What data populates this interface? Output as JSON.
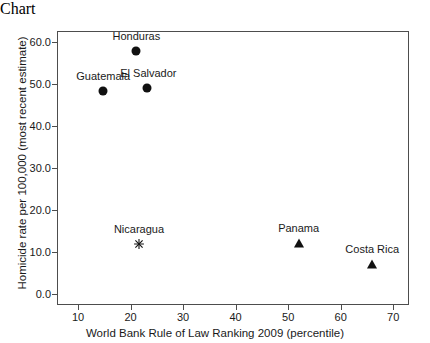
{
  "chart_data": {
    "type": "scatter",
    "title": "",
    "xlabel": "World Bank Rule of Law Ranking 2009 (percentile)",
    "ylabel": "Homicide rate per 100,000 (most recent estimate)",
    "xlim": [
      6.0,
      73.0
    ],
    "ylim": [
      -2.5,
      62.5
    ],
    "xticks": [
      10,
      20,
      30,
      40,
      50,
      60,
      70
    ],
    "xticklabels": [
      "10",
      "20",
      "30",
      "40",
      "50",
      "60",
      "70"
    ],
    "yticks": [
      0,
      10,
      20,
      30,
      40,
      50,
      60
    ],
    "yticklabels": [
      "0.0",
      "10.0",
      "20.0",
      "30.0",
      "40.0",
      "50.0",
      "60.0"
    ],
    "grid": false,
    "legend": "none",
    "marker_color": "#111111",
    "frame_color": "#4d4d4d",
    "background": "#ffffff",
    "points": [
      {
        "label": "Guatemala",
        "x": 14.8,
        "y": 48.3,
        "marker": "circle",
        "label_dx": 0,
        "label_dy": -9
      },
      {
        "label": "Honduras",
        "x": 21.1,
        "y": 57.8,
        "marker": "circle",
        "label_dx": 0,
        "label_dy": -9
      },
      {
        "label": "El Salvador",
        "x": 23.2,
        "y": 49.0,
        "marker": "circle",
        "label_dx": 1,
        "label_dy": -9
      },
      {
        "label": "Nicaragua",
        "x": 21.6,
        "y": 12.0,
        "marker": "star",
        "label_dx": 0,
        "label_dy": -9
      },
      {
        "label": "Panama",
        "x": 52.0,
        "y": 12.2,
        "marker": "triangle",
        "label_dx": 0,
        "label_dy": -9
      },
      {
        "label": "Costa Rica",
        "x": 66.0,
        "y": 7.3,
        "marker": "triangle",
        "label_dx": 0,
        "label_dy": -9
      }
    ]
  }
}
